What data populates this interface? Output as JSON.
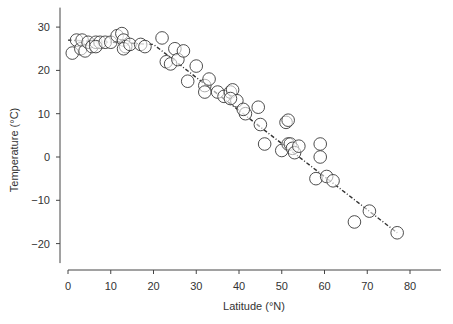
{
  "chart_data": {
    "type": "scatter",
    "title": "",
    "xlabel": "Latitude (°N)",
    "ylabel": "Temperature (°C)",
    "xlim": [
      -1,
      87
    ],
    "ylim": [
      -24.5,
      34.5
    ],
    "x_ticks": [
      0,
      10,
      20,
      30,
      40,
      50,
      60,
      70,
      80
    ],
    "y_ticks": [
      30,
      20,
      10,
      0,
      -10,
      -20
    ],
    "grid": false,
    "legend": null,
    "marker": "open-circle",
    "points": [
      [
        1,
        24
      ],
      [
        2,
        27
      ],
      [
        3,
        25
      ],
      [
        3.3,
        27
      ],
      [
        4,
        24.5
      ],
      [
        4.7,
        26.5
      ],
      [
        5.6,
        25.5
      ],
      [
        6.5,
        26.5
      ],
      [
        7.5,
        26.5
      ],
      [
        6.5,
        25.5
      ],
      [
        8.7,
        26.5
      ],
      [
        10,
        26.5
      ],
      [
        11.5,
        28
      ],
      [
        12.6,
        28.5
      ],
      [
        13,
        27
      ],
      [
        13.5,
        25.5
      ],
      [
        13,
        25
      ],
      [
        14.5,
        26
      ],
      [
        17,
        26
      ],
      [
        18,
        25.5
      ],
      [
        22,
        27.5
      ],
      [
        23,
        22
      ],
      [
        24,
        21.5
      ],
      [
        25,
        25
      ],
      [
        25.7,
        22.5
      ],
      [
        27,
        24.5
      ],
      [
        28,
        17.5
      ],
      [
        30,
        21
      ],
      [
        32,
        16.5
      ],
      [
        32,
        15
      ],
      [
        33,
        18
      ],
      [
        35,
        15
      ],
      [
        36.5,
        14
      ],
      [
        38,
        15
      ],
      [
        38.5,
        15.5
      ],
      [
        39.5,
        13
      ],
      [
        38,
        13.5
      ],
      [
        41.5,
        10
      ],
      [
        41,
        11
      ],
      [
        44.5,
        11.5
      ],
      [
        45,
        7.5
      ],
      [
        46,
        3
      ],
      [
        51,
        8
      ],
      [
        51.5,
        8.5
      ],
      [
        50,
        1.5
      ],
      [
        51.5,
        3
      ],
      [
        52,
        3
      ],
      [
        52.5,
        2
      ],
      [
        53,
        1
      ],
      [
        54,
        2.5
      ],
      [
        59,
        3
      ],
      [
        59,
        0
      ],
      [
        58,
        -5
      ],
      [
        60.5,
        -4.5
      ],
      [
        62,
        -5.5
      ],
      [
        67,
        -15
      ],
      [
        70.5,
        -12.5
      ],
      [
        77,
        -17.5
      ]
    ],
    "trend_line": {
      "style": "dash-dot",
      "points": [
        [
          0,
          27
        ],
        [
          20,
          26
        ],
        [
          77,
          -17.5
        ]
      ]
    }
  }
}
